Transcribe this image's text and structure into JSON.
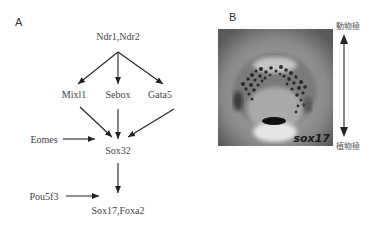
{
  "panel_a": {
    "label": "A",
    "nodes": {
      "ndr": "Ndr1,Ndr2",
      "mixl1": "Mixl1",
      "sebox": "Sebox",
      "gata5": "Gata5",
      "eomes": "Eomes",
      "sox32": "Sox32",
      "pou5f3": "Pou5f3",
      "sox17_foxa2": "Sox17,Foxa2"
    },
    "edges": [
      [
        "Ndr1,Ndr2",
        "Mixl1"
      ],
      [
        "Ndr1,Ndr2",
        "Sebox"
      ],
      [
        "Ndr1,Ndr2",
        "Gata5"
      ],
      [
        "Mixl1",
        "Sox32"
      ],
      [
        "Sebox",
        "Sox32"
      ],
      [
        "Gata5",
        "Sox32"
      ],
      [
        "Eomes",
        "Sox32"
      ],
      [
        "Sox32",
        "Sox17,Foxa2"
      ],
      [
        "Pou5f3",
        "Sox17,Foxa2"
      ]
    ]
  },
  "panel_b": {
    "label": "B",
    "photo_label": "sox17",
    "animal_pole": "動物極",
    "vegetal_pole": "植物極"
  }
}
